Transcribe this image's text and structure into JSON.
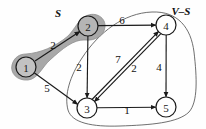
{
  "figure": {
    "kind": "directed-weighted-graph",
    "background_color": "#fefefe",
    "blob_fill_color": "#a8a8a8",
    "blob_stroke_color": "#8f8f8f",
    "node_stroke_color": "#1a1a1a",
    "edge_color": "#1a1a1a",
    "region_outline_color": "#555555"
  },
  "region_labels": {
    "source_set": "S",
    "complement_set": "V–S"
  },
  "nodes": [
    {
      "id": "1",
      "label": "1",
      "cx": 26,
      "cy": 67,
      "r": 10,
      "in_set": "S"
    },
    {
      "id": "2",
      "label": "2",
      "cx": 88,
      "cy": 26,
      "r": 10,
      "in_set": "S"
    },
    {
      "id": "3",
      "label": "3",
      "cx": 87,
      "cy": 108,
      "r": 10,
      "in_set": "V-S"
    },
    {
      "id": "4",
      "label": "4",
      "cx": 166,
      "cy": 25,
      "r": 10,
      "in_set": "V-S"
    },
    {
      "id": "5",
      "label": "5",
      "cx": 166,
      "cy": 107,
      "r": 10,
      "in_set": "V-S"
    }
  ],
  "edges": [
    {
      "from": "1",
      "to": "2",
      "weight": "2",
      "label_x": 53,
      "label_y": 45
    },
    {
      "from": "1",
      "to": "3",
      "weight": "5",
      "label_x": 47,
      "label_y": 88
    },
    {
      "from": "2",
      "to": "4",
      "weight": "6",
      "label_x": 122,
      "label_y": 20
    },
    {
      "from": "2",
      "to": "3",
      "weight": "2",
      "label_x": 79,
      "label_y": 67
    },
    {
      "from": "3",
      "to": "4",
      "weight": "7",
      "label_x": 118,
      "label_y": 59
    },
    {
      "from": "4",
      "to": "3",
      "weight": "2",
      "label_x": 134,
      "label_y": 68
    },
    {
      "from": "4",
      "to": "5",
      "weight": "4",
      "label_x": 159,
      "label_y": 67
    },
    {
      "from": "3",
      "to": "5",
      "weight": "1",
      "label_x": 127,
      "label_y": 110
    }
  ]
}
